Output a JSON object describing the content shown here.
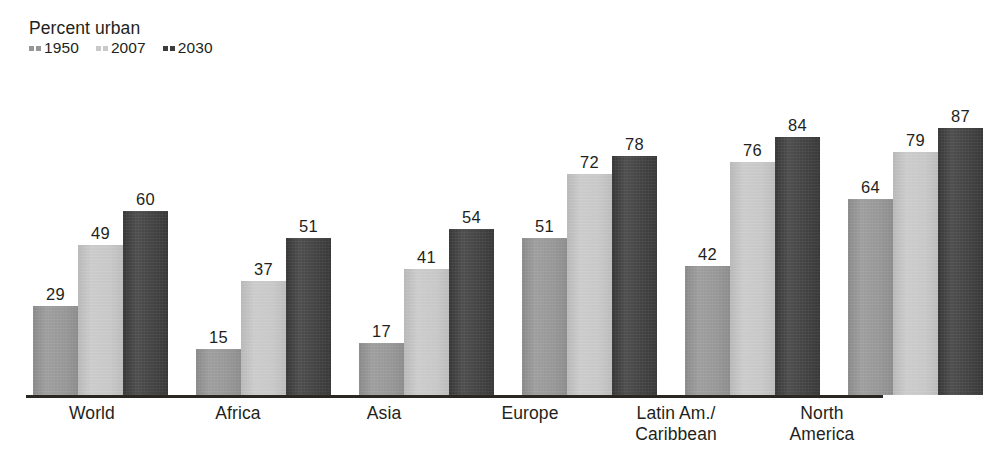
{
  "legend": {
    "title": "Percent urban",
    "entries": [
      {
        "label": "1950",
        "color": "#969696"
      },
      {
        "label": "2007",
        "color": "#c9c9c9"
      },
      {
        "label": "2030",
        "color": "#3c3c3c"
      }
    ]
  },
  "chart_data": {
    "type": "bar",
    "title": "Percent urban",
    "xlabel": "",
    "ylabel": "Percent urban",
    "ylim": [
      0,
      100
    ],
    "grid": false,
    "legend_position": "top-left",
    "categories": [
      "World",
      "Africa",
      "Asia",
      "Europe",
      "Latin Am./Caribbean",
      "North America"
    ],
    "category_lines": [
      [
        "World"
      ],
      [
        "Africa"
      ],
      [
        "Asia"
      ],
      [
        "Europe"
      ],
      [
        "Latin Am./",
        "Caribbean"
      ],
      [
        "North",
        "America"
      ]
    ],
    "series": [
      {
        "name": "1950",
        "color": "#969696",
        "values": [
          29,
          15,
          17,
          51,
          42,
          64
        ]
      },
      {
        "name": "2007",
        "color": "#c9c9c9",
        "values": [
          49,
          37,
          41,
          72,
          76,
          79
        ]
      },
      {
        "name": "2030",
        "color": "#3c3c3c",
        "values": [
          60,
          51,
          54,
          78,
          84,
          87
        ]
      }
    ],
    "value_labels": [
      [
        "29",
        "49",
        "60"
      ],
      [
        "15",
        "37",
        "51"
      ],
      [
        "17",
        "41",
        "54"
      ],
      [
        "51",
        "72",
        "78"
      ],
      [
        "42",
        "76",
        "84"
      ],
      [
        "64",
        "79",
        "87"
      ]
    ],
    "axis_color": "#2a2622"
  }
}
